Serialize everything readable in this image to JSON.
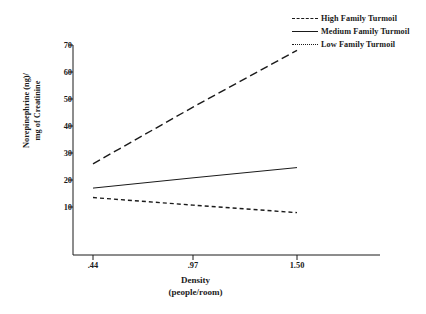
{
  "chart_data": {
    "type": "line",
    "title": "",
    "xlabel": "Density",
    "xlabel_sub": "(people/room)",
    "ylabel_line1": "Norepinephrine (ng)/",
    "ylabel_line2": "mg of Creatinine",
    "x": [
      0.44,
      0.97,
      1.5
    ],
    "xtick_labels": [
      ".44",
      ".97",
      "1.50"
    ],
    "ytick_labels": [
      "10",
      "20",
      "30",
      "40",
      "50",
      "60",
      "70"
    ],
    "ytick_values": [
      10,
      20,
      30,
      40,
      50,
      60,
      70
    ],
    "ylim": [
      0,
      72
    ],
    "xlim": [
      0.3,
      1.65
    ],
    "grid": false,
    "legend_position": "top-right",
    "series": [
      {
        "name": "High Family Turmoil",
        "style": "dashed",
        "values": [
          26.0,
          47.0,
          68.0
        ]
      },
      {
        "name": "Medium Family Turmoil",
        "style": "solid",
        "values": [
          17.0,
          20.8,
          24.6
        ]
      },
      {
        "name": "Low Family Turmoil",
        "style": "dotted",
        "values": [
          13.5,
          10.7,
          7.9
        ]
      }
    ],
    "line_color": "#1a1a1a",
    "background_color": "#ffffff"
  },
  "legend": {
    "items": [
      {
        "label": "High Family Turmoil",
        "style": "dashed"
      },
      {
        "label": "Medium Family Turmoil",
        "style": "solid"
      },
      {
        "label": "Low Family Turmoil",
        "style": "dotted"
      }
    ]
  },
  "axes": {
    "y_title_line1": "Norepinephrine (ng)/",
    "y_title_line2": "mg of Creatinine",
    "x_title_line1": "Density",
    "x_title_line2": "(people/room)",
    "y_ticks": [
      "70",
      "60",
      "50",
      "40",
      "30",
      "20",
      "10"
    ],
    "x_ticks": [
      ".44",
      ".97",
      "1.50"
    ]
  }
}
